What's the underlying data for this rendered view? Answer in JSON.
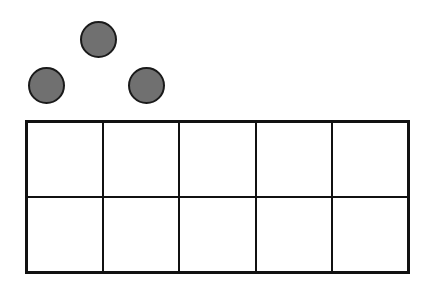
{
  "diagram": {
    "type": "ten-frame",
    "rows": 2,
    "columns": 5,
    "filled_cells": 0,
    "counters": [
      {
        "x": 80,
        "y": 21,
        "size": 37,
        "color": "#707070"
      },
      {
        "x": 28,
        "y": 67,
        "size": 37,
        "color": "#707070"
      },
      {
        "x": 128,
        "y": 67,
        "size": 37,
        "color": "#707070"
      }
    ],
    "counter_count": 3,
    "line_color": "#111111"
  }
}
